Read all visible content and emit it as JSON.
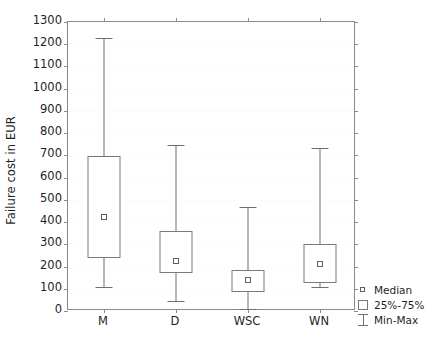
{
  "chart_data": {
    "type": "box",
    "title": "",
    "xlabel": "",
    "ylabel": "Failure cost in EUR",
    "ylim": [
      0,
      1300
    ],
    "ytick_step": 100,
    "yticks": [
      0,
      100,
      200,
      300,
      400,
      500,
      600,
      700,
      800,
      900,
      1000,
      1100,
      1200,
      1300
    ],
    "ytick_labels": [
      "0",
      "100",
      "200",
      "300",
      "400",
      "500",
      "600",
      "700",
      "800",
      "900",
      "1000",
      "1100",
      "1200",
      "1300"
    ],
    "categories": [
      "M",
      "D",
      "WSC",
      "WN"
    ],
    "grid": true,
    "legend_position": "right-bottom-outside",
    "boxes": [
      {
        "category": "M",
        "min": 110,
        "q1": 240,
        "median": 425,
        "q3": 695,
        "max": 1230
      },
      {
        "category": "D",
        "min": 45,
        "q1": 170,
        "median": 225,
        "q3": 360,
        "max": 745
      },
      {
        "category": "WSC",
        "min": 10,
        "q1": 85,
        "median": 140,
        "q3": 185,
        "max": 470
      },
      {
        "category": "WN",
        "min": 110,
        "q1": 125,
        "median": 210,
        "q3": 300,
        "max": 735
      }
    ],
    "legend": [
      {
        "label": "Median",
        "glyph": "small-open-square"
      },
      {
        "label": "25%-75%",
        "glyph": "open-square"
      },
      {
        "label": "Min-Max",
        "glyph": "i-beam"
      }
    ],
    "colors": {
      "background": "#ffffff",
      "axis": "#8a8a8a",
      "box_stroke": "#7a7a7a",
      "whisker": "#6f6f6f",
      "median_marker": "#606060",
      "gridline": "#fbfbfb",
      "text": "#1f1f1f"
    }
  }
}
